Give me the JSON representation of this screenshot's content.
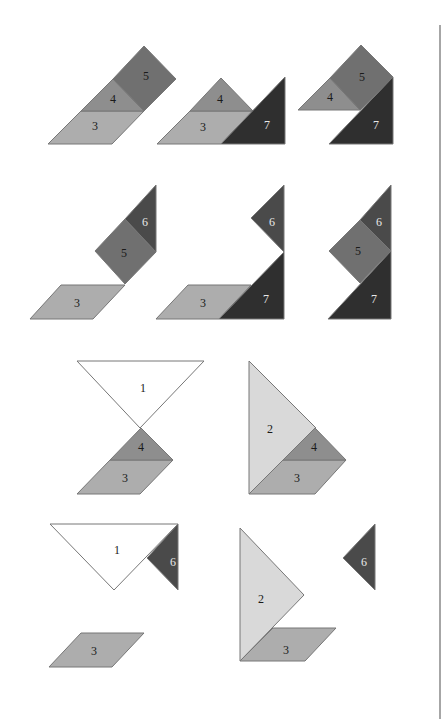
{
  "colors": {
    "piece1": "#ffffff",
    "piece2": "#d9d9d9",
    "piece3": "#adadad",
    "piece4": "#8e8e8e",
    "piece5": "#707070",
    "piece6": "#4a4a4a",
    "piece7": "#2f2f2f",
    "divider": "#888888"
  },
  "figures": [
    {
      "id": "fig1",
      "pieces": [
        {
          "label": "3",
          "points": "48,144 112,144 144,111 81,111",
          "color": "piece3",
          "lx": 95,
          "ly": 127,
          "light": false
        },
        {
          "label": "4",
          "points": "81,111 144,111 113,79",
          "color": "piece4",
          "lx": 113,
          "ly": 100,
          "light": false
        },
        {
          "label": "5",
          "points": "113,79 144,111 176,79 144,46",
          "color": "piece5",
          "lx": 146,
          "ly": 77,
          "light": false
        }
      ]
    },
    {
      "id": "fig2",
      "pieces": [
        {
          "label": "3",
          "points": "157,144 221,144 253,111 190,111",
          "color": "piece3",
          "lx": 203,
          "ly": 128,
          "light": false
        },
        {
          "label": "4",
          "points": "190,111 253,111 221,78",
          "color": "piece4",
          "lx": 220,
          "ly": 100,
          "light": false
        },
        {
          "label": "7",
          "points": "221,144 285,144 285,77",
          "color": "piece7",
          "lx": 267,
          "ly": 126,
          "light": true
        }
      ]
    },
    {
      "id": "fig3",
      "pieces": [
        {
          "label": "4",
          "points": "298,110 360,110 330,78",
          "color": "piece4",
          "lx": 330,
          "ly": 98,
          "light": false
        },
        {
          "label": "5",
          "points": "330,78 360,110 393,77 361,45",
          "color": "piece5",
          "lx": 362,
          "ly": 78,
          "light": false
        },
        {
          "label": "7",
          "points": "329,144 393,144 393,77",
          "color": "piece7",
          "lx": 376,
          "ly": 126,
          "light": true
        }
      ]
    },
    {
      "id": "fig4",
      "pieces": [
        {
          "label": "3",
          "points": "30,319 93,319 125,285 61,285",
          "color": "piece3",
          "lx": 77,
          "ly": 304,
          "light": false
        },
        {
          "label": "5",
          "points": "95,251 125,284 156,252 125,219",
          "color": "piece5",
          "lx": 124,
          "ly": 254,
          "light": false
        },
        {
          "label": "6",
          "points": "125,219 156,252 156,185",
          "color": "piece6",
          "lx": 145,
          "ly": 223,
          "light": true
        }
      ]
    },
    {
      "id": "fig5",
      "pieces": [
        {
          "label": "3",
          "points": "156,319 219,319 251,285 188,285",
          "color": "piece3",
          "lx": 203,
          "ly": 304,
          "light": false
        },
        {
          "label": "7",
          "points": "219,319 284,319 284,252",
          "color": "piece7",
          "lx": 266,
          "ly": 300,
          "light": true
        },
        {
          "label": "6",
          "points": "251,218 284,252 284,185",
          "color": "piece6",
          "lx": 272,
          "ly": 223,
          "light": true
        }
      ]
    },
    {
      "id": "fig6",
      "pieces": [
        {
          "label": "5",
          "points": "329,251 360,283 391,251 360,220",
          "color": "piece5",
          "lx": 358,
          "ly": 252,
          "light": false
        },
        {
          "label": "6",
          "points": "360,220 391,251 391,185",
          "color": "piece6",
          "lx": 379,
          "ly": 223,
          "light": true
        },
        {
          "label": "7",
          "points": "328,319 391,319 391,251",
          "color": "piece7",
          "lx": 374,
          "ly": 300,
          "light": true
        }
      ]
    },
    {
      "id": "fig7",
      "pieces": [
        {
          "label": "1",
          "points": "77,361 204,361 140,428",
          "color": "piece1",
          "lx": 143,
          "ly": 389,
          "light": false
        },
        {
          "label": "3",
          "points": "77,494 140,494 173,460 110,460",
          "color": "piece3",
          "lx": 125,
          "ly": 479,
          "light": false
        },
        {
          "label": "4",
          "points": "110,460 173,460 141,428",
          "color": "piece4",
          "lx": 141,
          "ly": 448,
          "light": false
        }
      ]
    },
    {
      "id": "fig8",
      "pieces": [
        {
          "label": "2",
          "points": "249,361 249,494 316,428",
          "color": "piece2",
          "lx": 270,
          "ly": 430,
          "light": false
        },
        {
          "label": "3",
          "points": "249,494 315,494 346,460 283,460",
          "color": "piece3",
          "lx": 297,
          "ly": 479,
          "light": false
        },
        {
          "label": "4",
          "points": "283,460 346,460 315,428",
          "color": "piece4",
          "lx": 314,
          "ly": 448,
          "light": false
        }
      ]
    },
    {
      "id": "fig9",
      "pieces": [
        {
          "label": "1",
          "points": "50,524 178,524 114,590",
          "color": "piece1",
          "lx": 117,
          "ly": 551,
          "light": false
        },
        {
          "label": "6",
          "points": "147,558 178,524 178,590",
          "color": "piece6",
          "lx": 173,
          "ly": 563,
          "light": true
        },
        {
          "label": "3",
          "points": "49,667 112,667 144,633 81,633",
          "color": "piece3",
          "lx": 94,
          "ly": 652,
          "light": false
        }
      ]
    },
    {
      "id": "fig10",
      "pieces": [
        {
          "label": "2",
          "points": "240,528 240,661 304,595",
          "color": "piece2",
          "lx": 261,
          "ly": 600,
          "light": false
        },
        {
          "label": "3",
          "points": "240,661 305,661 336,628 273,628",
          "color": "piece3",
          "lx": 286,
          "ly": 651,
          "light": false
        },
        {
          "label": "6",
          "points": "343,558 375,524 375,590",
          "color": "piece6",
          "lx": 364,
          "ly": 563,
          "light": true
        }
      ]
    }
  ],
  "divider": {
    "x": 440,
    "y1": 25,
    "y2": 719
  }
}
